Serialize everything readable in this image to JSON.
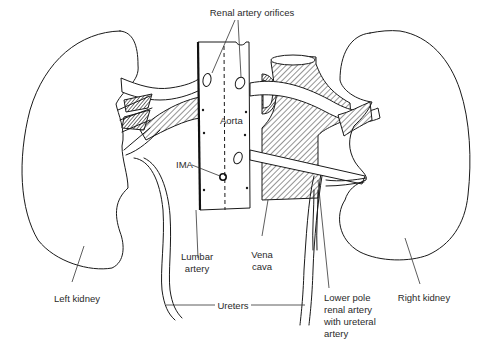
{
  "figure": {
    "type": "anatomical-illustration"
  },
  "labels": {
    "renal_artery_orifices": "Renal artery orifices",
    "aorta": "Aorta",
    "ima": "IMA",
    "lumbar_artery": [
      "Lumbar",
      "artery"
    ],
    "vena_cava": [
      "Vena",
      "cava"
    ],
    "ureters": "Ureters",
    "left_kidney": "Left kidney",
    "right_kidney": "Right kidney",
    "lower_pole": [
      "Lower pole",
      "renal artery",
      "with ureteral",
      "artery"
    ]
  },
  "colors": {
    "ink": "#1a1a1a",
    "label": "#2a2a2a",
    "background": "#ffffff"
  }
}
